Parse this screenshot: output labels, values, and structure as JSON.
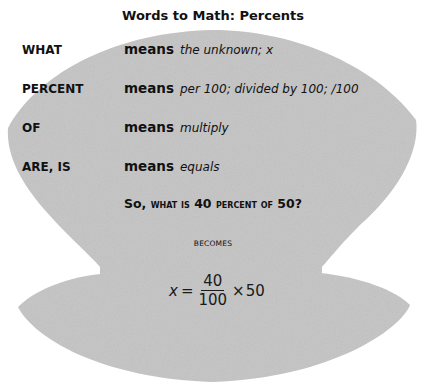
{
  "title": "Words to Math: Percents",
  "colors": {
    "shape_fill": "#c4c4c4",
    "text": "#111111",
    "background": "#ffffff"
  },
  "rows": [
    {
      "term": "WHAT",
      "means": "means",
      "definition": "the unknown;  x"
    },
    {
      "term": "PERCENT",
      "means": "means",
      "definition": "per 100;  divided by 100;   /100"
    },
    {
      "term": "OF",
      "means": "means",
      "definition": "multiply"
    },
    {
      "term": "ARE, IS",
      "means": "means",
      "definition": "equals"
    }
  ],
  "question": {
    "part1": "So,",
    "part2": "what is",
    "part3": "40",
    "part4": "percent of",
    "part5": "50?"
  },
  "becomes_label": "BECOMES",
  "formula": {
    "variable": "x",
    "equals": "=",
    "numerator": "40",
    "denominator": "100",
    "times": "×",
    "multiplier": "50"
  }
}
